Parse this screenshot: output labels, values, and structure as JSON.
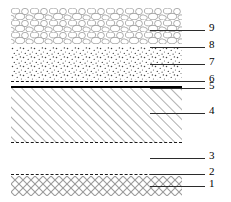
{
  "figure": {
    "type": "stratigraphic-cross-section",
    "orientation": "horizontal-layers",
    "background_color": "#ffffff",
    "line_color": "#2b2b2b",
    "stack_left_px": 11,
    "stack_right_px": 182
  },
  "labels": [
    {
      "id": "9",
      "text": "9",
      "leader_y": 30,
      "leader_x1": 150,
      "leader_x2": 205,
      "num_x": 209
    },
    {
      "id": "8",
      "text": "8",
      "leader_y": 47,
      "leader_x1": 150,
      "leader_x2": 205,
      "num_x": 209
    },
    {
      "id": "7",
      "text": "7",
      "leader_y": 64,
      "leader_x1": 150,
      "leader_x2": 205,
      "num_x": 209
    },
    {
      "id": "6",
      "text": "6",
      "leader_y": 81,
      "leader_x1": 150,
      "leader_x2": 205,
      "num_x": 209
    },
    {
      "id": "5",
      "text": "5",
      "leader_y": 88,
      "leader_x1": 150,
      "leader_x2": 205,
      "num_x": 209
    },
    {
      "id": "4",
      "text": "4",
      "leader_y": 113,
      "leader_x1": 150,
      "leader_x2": 205,
      "num_x": 209
    },
    {
      "id": "3",
      "text": "3",
      "leader_y": 158,
      "leader_x1": 150,
      "leader_x2": 205,
      "num_x": 209
    },
    {
      "id": "2",
      "text": "2",
      "leader_y": 174,
      "leader_x1": 150,
      "leader_x2": 205,
      "num_x": 209
    },
    {
      "id": "1",
      "text": "1",
      "leader_y": 186,
      "leader_x1": 150,
      "leader_x2": 205,
      "num_x": 209
    }
  ],
  "layers": [
    {
      "label": "9",
      "pattern": "rounded-aggregate-cobbles",
      "top": 8,
      "height": 36,
      "fill": "#ffffff",
      "stroke": "#8a8a8a"
    },
    {
      "label": "8",
      "pattern": "dashed-interface-line",
      "top": 47,
      "height": 0,
      "stroke": "#1a1a1a"
    },
    {
      "label": "7",
      "pattern": "stipple-sand",
      "top": 47,
      "height": 33,
      "fill": "#ffffff",
      "stroke": "#444444"
    },
    {
      "label": "6",
      "pattern": "dashed-interface-line",
      "top": 81,
      "height": 0,
      "stroke": "#1a1a1a"
    },
    {
      "label": "5",
      "pattern": "solid-heavy-rule",
      "top": 87,
      "height": 0,
      "stroke": "#000000"
    },
    {
      "label": "4",
      "pattern": "diagonal-hatch",
      "top": 88,
      "height": 54,
      "fill": "#ffffff",
      "stroke": "#6e6e6e"
    },
    {
      "label": "3",
      "pattern": "void-blank-gap",
      "top": 143,
      "height": 30,
      "fill": "#ffffff"
    },
    {
      "label": "2",
      "pattern": "dashed-interface-line",
      "top": 174,
      "height": 0,
      "stroke": "#1a1a1a"
    },
    {
      "label": "1",
      "pattern": "cross-hatch",
      "top": 176,
      "height": 20,
      "fill": "#ffffff",
      "stroke": "#9a9a9a"
    }
  ]
}
